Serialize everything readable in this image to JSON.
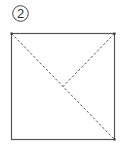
{
  "step": {
    "number": "2"
  },
  "diagram": {
    "type": "origami-fold-diagram",
    "shape": "square",
    "square": {
      "x": 11,
      "y": 33,
      "width": 104,
      "height": 107
    },
    "lines": [
      {
        "name": "full-diagonal",
        "style": "dashed",
        "from": "top-left",
        "to": "bottom-right"
      },
      {
        "name": "half-diagonal",
        "style": "dashed",
        "from": "top-right",
        "to": "center"
      }
    ],
    "colors": {
      "outline": "#555555",
      "fold_line": "#555555",
      "background": "#ffffff"
    }
  }
}
